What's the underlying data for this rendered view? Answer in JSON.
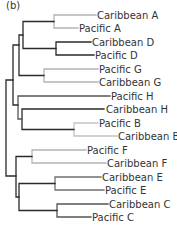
{
  "panel_label": "(b)",
  "colors": {
    "dark": "#2a2a2a",
    "medium": "#707070",
    "light": "#b4b4b4"
  },
  "leaves": [
    {
      "label": "Caribbean A",
      "y": 15,
      "x_end": 96,
      "color": "light"
    },
    {
      "label": "Pacific A",
      "y": 28,
      "x_end": 78,
      "color": "light"
    },
    {
      "label": "Caribbean D",
      "y": 42,
      "x_end": 91,
      "color": "dark"
    },
    {
      "label": "Pacific D",
      "y": 55,
      "x_end": 94,
      "color": "dark"
    },
    {
      "label": "Pacific G",
      "y": 69,
      "x_end": 98,
      "color": "light"
    },
    {
      "label": "Caribbean G",
      "y": 82,
      "x_end": 98,
      "color": "light"
    },
    {
      "label": "Pacific H",
      "y": 96,
      "x_end": 110,
      "color": "dark"
    },
    {
      "label": "Caribbean H",
      "y": 109,
      "x_end": 104,
      "color": "dark"
    },
    {
      "label": "Pacific B",
      "y": 123,
      "x_end": 98,
      "color": "light"
    },
    {
      "label": "Caribbean B",
      "y": 136,
      "x_end": 117,
      "color": "light"
    },
    {
      "label": "Pacific F",
      "y": 150,
      "x_end": 86,
      "color": "light"
    },
    {
      "label": "Caribbean F",
      "y": 163,
      "x_end": 106,
      "color": "light"
    },
    {
      "label": "Caribbean E",
      "y": 177,
      "x_end": 101,
      "color": "medium"
    },
    {
      "label": "Pacific E",
      "y": 190,
      "x_end": 104,
      "color": "medium"
    },
    {
      "label": "Caribbean C",
      "y": 204,
      "x_end": 108,
      "color": "medium"
    },
    {
      "label": "Pacific C",
      "y": 217,
      "x_end": 91,
      "color": "dark"
    }
  ]
}
